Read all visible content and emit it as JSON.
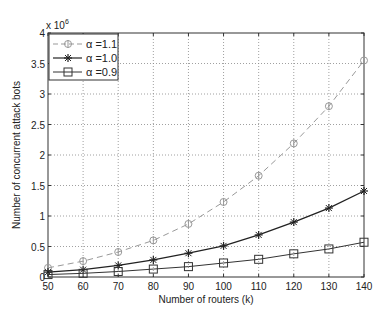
{
  "chart_data": {
    "type": "line",
    "title": "",
    "xlabel": "Number of routers (k)",
    "ylabel": "Number of concurrent attack bots",
    "y_multiplier_label": "x 10",
    "y_multiplier_exponent": "6",
    "x": [
      50,
      60,
      70,
      80,
      90,
      100,
      110,
      120,
      130,
      140
    ],
    "xlim": [
      50,
      140
    ],
    "ylim": [
      0,
      4
    ],
    "x_ticks": [
      "50",
      "60",
      "70",
      "80",
      "90",
      "100",
      "110",
      "120",
      "130",
      "140"
    ],
    "y_ticks": [
      "0",
      "0.5",
      "1",
      "1.5",
      "2",
      "2.5",
      "3",
      "3.5",
      "4"
    ],
    "grid": true,
    "legend_position": "upper left",
    "series": [
      {
        "name": "α =1.1",
        "marker": "diamond-circle",
        "line_style": "dashed",
        "color": "#999999",
        "values": [
          0.15,
          0.26,
          0.41,
          0.6,
          0.87,
          1.23,
          1.66,
          2.19,
          2.8,
          3.55
        ]
      },
      {
        "name": "α =1.0",
        "marker": "star",
        "line_style": "solid",
        "color": "#222222",
        "values": [
          0.08,
          0.12,
          0.19,
          0.28,
          0.39,
          0.51,
          0.69,
          0.9,
          1.13,
          1.41
        ]
      },
      {
        "name": "α =0.9",
        "marker": "square",
        "line_style": "solid",
        "color": "#333333",
        "values": [
          0.04,
          0.06,
          0.09,
          0.13,
          0.17,
          0.23,
          0.29,
          0.38,
          0.46,
          0.57
        ]
      }
    ]
  }
}
